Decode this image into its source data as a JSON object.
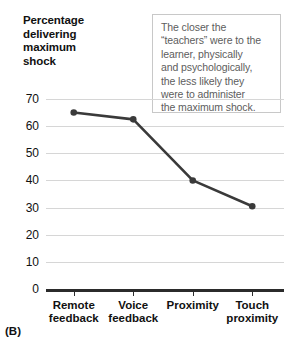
{
  "figure": {
    "panel_label": "(B)",
    "y_axis_title_lines": [
      "Percentage",
      "delivering",
      "maximum",
      "shock"
    ]
  },
  "callout": {
    "lines": [
      "The closer the",
      "“teachers” were to the",
      "learner, physically",
      "and psychologically,",
      "the less likely they",
      "were to administer",
      "the maximum shock."
    ],
    "border_color": "#c8c8c8",
    "text_color": "#5d5d5d"
  },
  "chart_data": {
    "type": "line",
    "title": "",
    "xlabel": "",
    "ylabel": "Percentage delivering maximum shock",
    "categories": [
      "Remote feedback",
      "Voice feedback",
      "Proximity",
      "Touch proximity"
    ],
    "category_lines": [
      [
        "Remote",
        "feedback"
      ],
      [
        "Voice",
        "feedback"
      ],
      [
        "Proximity"
      ],
      [
        "Touch",
        "proximity"
      ]
    ],
    "values": [
      65,
      62.5,
      40,
      30.5
    ],
    "ylim": [
      0,
      70
    ],
    "yticks": [
      0,
      10,
      20,
      30,
      40,
      50,
      60,
      70
    ],
    "ytick_labels": [
      "0",
      "10",
      "20",
      "30",
      "40",
      "50",
      "60",
      "70"
    ],
    "grid": true,
    "legend": false,
    "series_color": "#3a3a3a",
    "grid_color": "#d6d6d6",
    "axis_color": "#2b2b2b"
  }
}
